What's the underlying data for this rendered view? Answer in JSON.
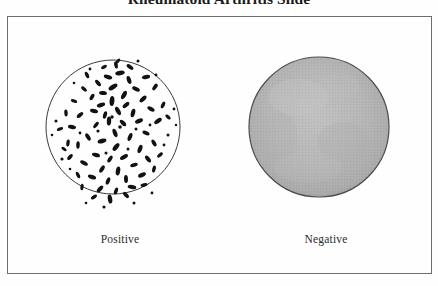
{
  "figure": {
    "title": "Rheumatoid Arthritis Slide",
    "frame_border_color": "#6e6e6e",
    "background_color": "#ffffff"
  },
  "panels": [
    {
      "id": "positive",
      "caption": "Positive",
      "result": "Positive",
      "circle": {
        "center_x": 112,
        "center_y": 126,
        "radius": 67,
        "outline_color": "#3a3a3a",
        "fill_color": "#ffffff",
        "fill_description": "white with scattered dark agglutinated particles"
      },
      "particle_color": "#111111",
      "particle_count": 118,
      "particle_description": "irregular dark rod and oval shaped clumps, densest in the upper-central region"
    },
    {
      "id": "negative",
      "caption": "Negative",
      "result": "Negative",
      "circle": {
        "center_x": 318,
        "center_y": 126,
        "radius": 70,
        "outline_color": "#4a4a4a",
        "fill_color": "#b5b5b5",
        "fill_description": "uniform smooth gray stippled suspension, no agglutination"
      },
      "particle_color": "#9a9a9a",
      "particle_count": 0,
      "particle_description": "no visible clumping; even milky gray appearance"
    }
  ]
}
